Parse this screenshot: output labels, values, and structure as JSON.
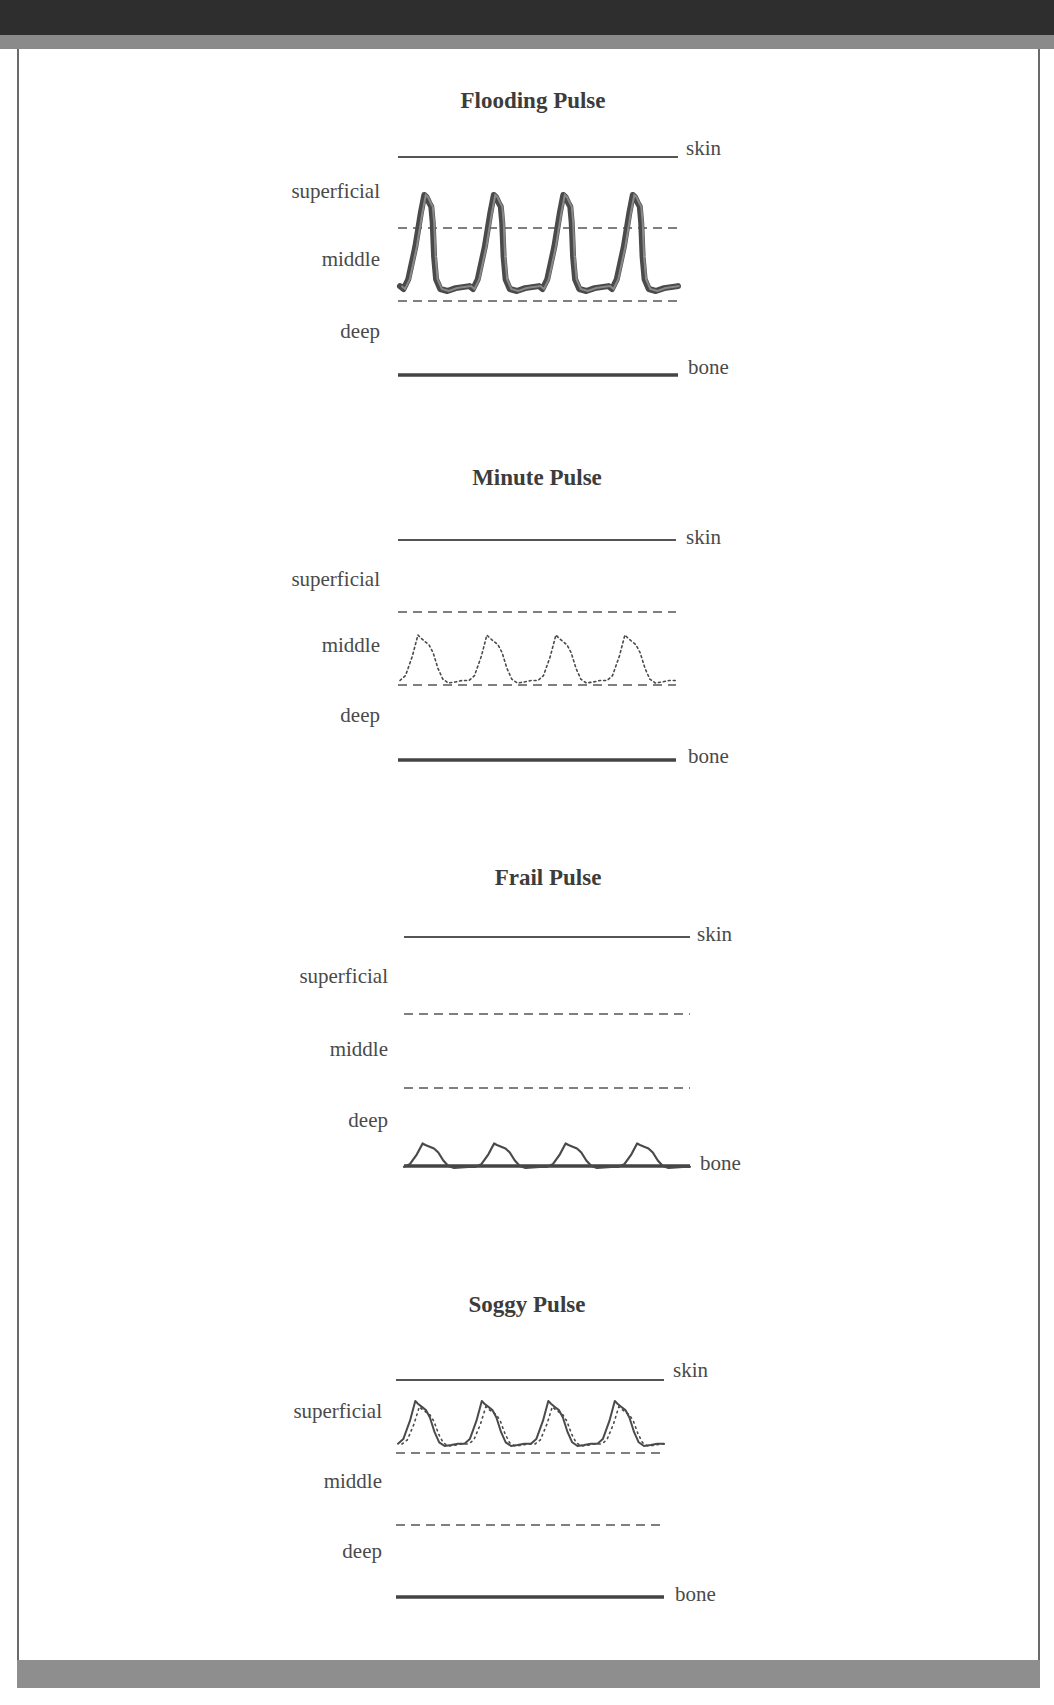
{
  "frame": {
    "top_band_color": "#2e2e2e",
    "mid_band_color": "#8a8a8a",
    "bottom_band_color": "#8e8e8e",
    "caption": ""
  },
  "layer_labels": {
    "superficial": "superficial",
    "middle": "middle",
    "deep": "deep",
    "skin": "skin",
    "bone": "bone"
  },
  "panels": [
    {
      "id": "flooding",
      "title": "Flooding Pulse",
      "title_x": 533,
      "title_y": 108,
      "x_start": 398,
      "x_end": 678,
      "skin_y": 157,
      "dash1_y": 228,
      "dash2_y": 301,
      "bone_y": 375,
      "label_x": 380,
      "superficial_y": 198,
      "middle_y": 266,
      "deep_y": 338,
      "skin_label": {
        "x": 686,
        "y": 155
      },
      "bone_label": {
        "x": 688,
        "y": 374
      },
      "wave": {
        "style": "thick",
        "cycles": 4,
        "x0": 400,
        "x1": 678,
        "top": 193,
        "bottom": 291,
        "stroke": 6,
        "color": "#4a4a4a",
        "dotted_overlay": false,
        "sharp_fall": true
      }
    },
    {
      "id": "minute",
      "title": "Minute Pulse",
      "title_x": 537,
      "title_y": 485,
      "x_start": 398,
      "x_end": 676,
      "skin_y": 540,
      "dash1_y": 612,
      "dash2_y": 685,
      "bone_y": 760,
      "label_x": 380,
      "superficial_y": 586,
      "middle_y": 652,
      "deep_y": 722,
      "skin_label": {
        "x": 686,
        "y": 544
      },
      "bone_label": {
        "x": 688,
        "y": 763
      },
      "wave": {
        "style": "dotted",
        "cycles": 4,
        "x0": 400,
        "x1": 676,
        "top": 634,
        "bottom": 683,
        "stroke": 1.6,
        "color": "#4a4a4a",
        "dotted_overlay": false,
        "sharp_fall": false
      }
    },
    {
      "id": "frail",
      "title": "Frail Pulse",
      "title_x": 548,
      "title_y": 885,
      "x_start": 404,
      "x_end": 690,
      "skin_y": 937,
      "dash1_y": 1014,
      "dash2_y": 1088,
      "bone_y": 1166,
      "label_x": 388,
      "superficial_y": 983,
      "middle_y": 1056,
      "deep_y": 1127,
      "skin_label": {
        "x": 697,
        "y": 941
      },
      "bone_label": {
        "x": 700,
        "y": 1170
      },
      "wave": {
        "style": "solid",
        "cycles": 4,
        "x0": 404,
        "x1": 690,
        "top": 1143,
        "bottom": 1168,
        "stroke": 2.2,
        "color": "#4a4a4a",
        "dotted_overlay": false,
        "sharp_fall": false
      }
    },
    {
      "id": "soggy",
      "title": "Soggy Pulse",
      "title_x": 527,
      "title_y": 1312,
      "x_start": 396,
      "x_end": 664,
      "skin_y": 1380,
      "dash1_y": 1453,
      "dash2_y": 1525,
      "bone_y": 1597,
      "label_x": 382,
      "superficial_y": 1418,
      "middle_y": 1488,
      "deep_y": 1558,
      "skin_label": {
        "x": 673,
        "y": 1377
      },
      "bone_label": {
        "x": 675,
        "y": 1601
      },
      "wave": {
        "style": "solid",
        "cycles": 4,
        "x0": 398,
        "x1": 664,
        "top": 1400,
        "bottom": 1446,
        "stroke": 2,
        "color": "#4a4a4a",
        "dotted_overlay": true,
        "sharp_fall": false
      }
    }
  ]
}
